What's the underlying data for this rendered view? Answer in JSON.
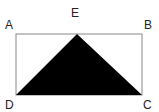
{
  "diagram": {
    "type": "geometry",
    "points": {
      "A": {
        "label": "A",
        "x": 16,
        "y": 34
      },
      "B": {
        "label": "B",
        "x": 142,
        "y": 34
      },
      "C": {
        "label": "C",
        "x": 142,
        "y": 95
      },
      "D": {
        "label": "D",
        "x": 16,
        "y": 95
      },
      "E": {
        "label": "E",
        "x": 77,
        "y": 34
      }
    },
    "shapes": [
      {
        "type": "rectangle",
        "vertices": [
          "A",
          "B",
          "C",
          "D"
        ],
        "fill": "none",
        "stroke": "#888888"
      },
      {
        "type": "triangle",
        "vertices": [
          "E",
          "D",
          "C"
        ],
        "fill": "#000000"
      }
    ],
    "colors": {
      "stroke": "#888888",
      "fill": "#000000"
    }
  }
}
